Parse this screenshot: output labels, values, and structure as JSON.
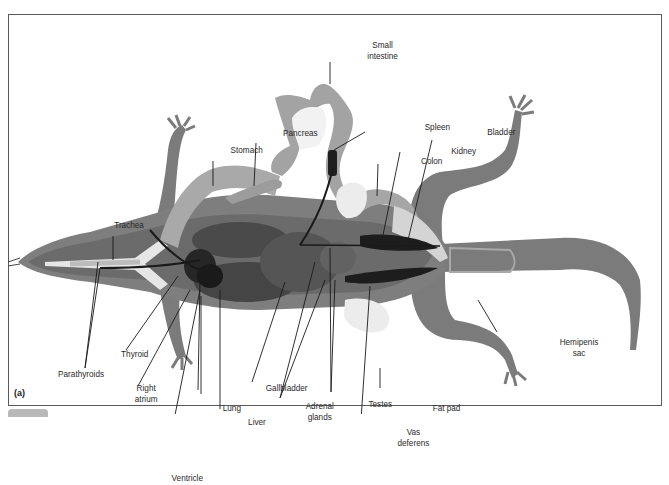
{
  "figure": {
    "panel_label": "(a)"
  },
  "labels": {
    "small_intestine": "Small\nintestine",
    "spleen": "Spleen",
    "pancreas": "Pancreas",
    "stomach": "Stomach",
    "bladder": "Bladder",
    "kidney": "Kidney",
    "colon": "Colon",
    "trachea": "Trachea",
    "thyroid": "Thyroid",
    "parathyroids": "Parathyroids",
    "right_atrium": "Right\natrium",
    "lung": "Lung",
    "liver": "Liver",
    "gallbladder": "Gallbladder",
    "adrenal_glands": "Adrenal\nglands",
    "testes": "Testes",
    "fat_pad": "Fat pad",
    "vas_deferens": "Vas\ndeferens",
    "hemipenis_sac": "Hemipenis\nsac",
    "ventricle": "Ventricle"
  },
  "colors": {
    "body": "#7a7a7a",
    "organ_light": "#a8a8a8",
    "organ_dark": "#3f3f3f",
    "organ_black": "#1e1e1e",
    "fat": "#e6e6e6",
    "frame": "#5a5a5a"
  }
}
